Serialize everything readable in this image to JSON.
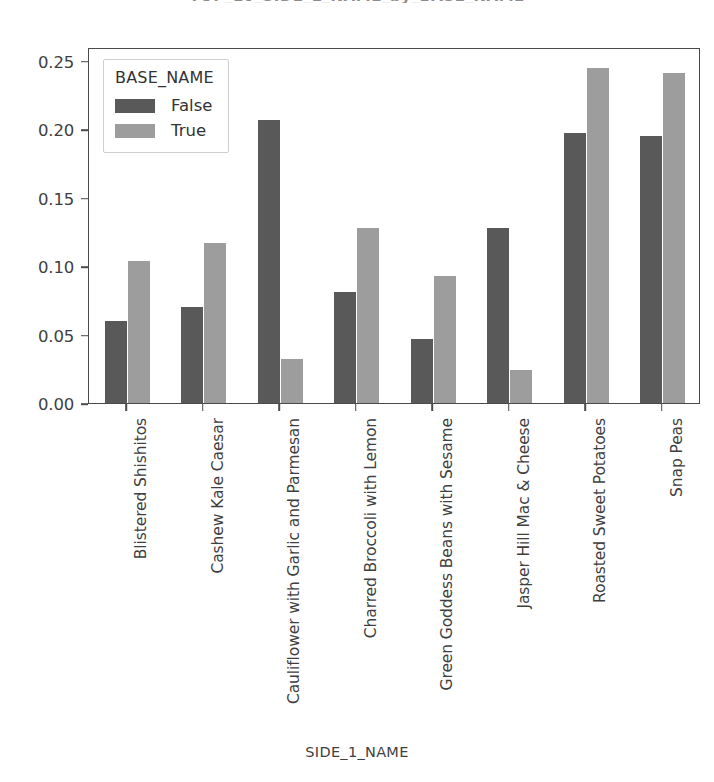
{
  "cropped_title_fragment": "TOP_10_SIDE_1_NAME_by_BASE_NAME",
  "chart_data": {
    "type": "bar",
    "title": "",
    "xlabel": "SIDE_1_NAME",
    "ylabel": "",
    "categories": [
      "Blistered Shishitos",
      "Cashew Kale Caesar",
      "Cauliflower with Garlic and Parmesan",
      "Charred Broccoli with Lemon",
      "Green Goddess Beans with Sesame",
      "Jasper Hill Mac & Cheese",
      "Roasted Sweet Potatoes",
      "Snap Peas"
    ],
    "series": [
      {
        "name": "False",
        "color": "#595959",
        "values": [
          0.06,
          0.07,
          0.207,
          0.081,
          0.047,
          0.128,
          0.197,
          0.195
        ]
      },
      {
        "name": "True",
        "color": "#9d9d9d",
        "values": [
          0.104,
          0.117,
          0.032,
          0.128,
          0.093,
          0.024,
          0.245,
          0.241
        ]
      }
    ],
    "ylim": [
      0.0,
      0.26
    ],
    "yticks": [
      0.0,
      0.05,
      0.1,
      0.15,
      0.2,
      0.25
    ],
    "ytick_labels": [
      "0.00",
      "0.05",
      "0.10",
      "0.15",
      "0.20",
      "0.25"
    ],
    "grid": false,
    "legend": {
      "title": "BASE_NAME",
      "position": "upper-left",
      "entries": [
        "False",
        "True"
      ]
    }
  }
}
